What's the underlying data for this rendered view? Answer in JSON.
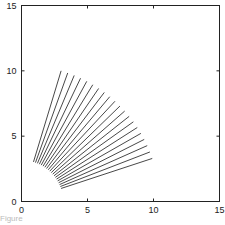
{
  "chart_data": {
    "type": "line",
    "title": "",
    "xlabel": "",
    "ylabel": "",
    "xlim": [
      0,
      15
    ],
    "ylim": [
      0,
      15
    ],
    "xticks": [
      0,
      5,
      10,
      15
    ],
    "yticks": [
      0,
      5,
      10,
      15
    ],
    "grid": false,
    "legend": null,
    "segments": {
      "count": 20,
      "r_inner": 3.16,
      "r_outer": 10.44,
      "angle_start_deg": 73.3,
      "angle_end_deg": 18.4,
      "first": {
        "x0": 0.9,
        "y0": 3.0,
        "x1": 3.0,
        "y1": 10.0
      },
      "last": {
        "x0": 3.0,
        "y0": 1.0,
        "x1": 10.0,
        "y1": 3.0
      }
    },
    "line_color": "#333333"
  },
  "caption": "Figure"
}
